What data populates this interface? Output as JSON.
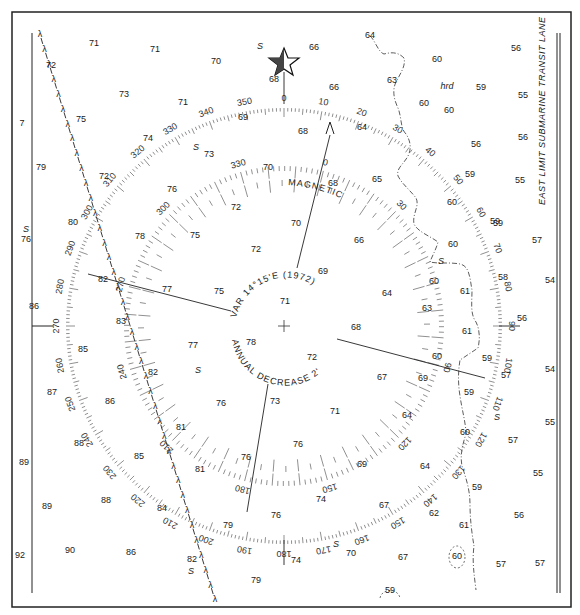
{
  "chart": {
    "type": "nautical-chart-compass-rose",
    "colors": {
      "ink": "#1a1a1a",
      "paper": "#ffffff",
      "frame": "#222222"
    },
    "compass": {
      "center": [
        284,
        326
      ],
      "true_ring": {
        "radius": 218,
        "rotation_deg": 0,
        "labels": [
          "0",
          "10",
          "20",
          "30",
          "40",
          "50",
          "60",
          "70",
          "80",
          "90",
          "100",
          "110",
          "120",
          "130",
          "140",
          "150",
          "160",
          "170",
          "180",
          "190",
          "200",
          "210",
          "220",
          "230",
          "240",
          "250",
          "260",
          "270",
          "280",
          "290",
          "300",
          "310",
          "320",
          "330",
          "340",
          "350"
        ]
      },
      "magnetic_ring": {
        "radius": 160,
        "rotation_deg": 14.25,
        "visible_labels": [
          "0",
          "30",
          "90",
          "120",
          "150",
          "180",
          "210",
          "240",
          "270",
          "300",
          "330"
        ]
      },
      "magnetic_label": "MAGNETIC",
      "variation_text": "VAR 14°15'E (1972)",
      "annual_text": "ANNUAL DECREASE 2'",
      "north_star": "star-icon"
    },
    "lane_label": "EAST LIMIT SUBMARINE TRANSIT LANE",
    "seabed_notes": [
      {
        "text": "S",
        "x": 260,
        "y": 47
      },
      {
        "text": "S",
        "x": 196,
        "y": 148
      },
      {
        "text": "S",
        "x": 26,
        "y": 230
      },
      {
        "text": "S",
        "x": 198,
        "y": 371
      },
      {
        "text": "S",
        "x": 441,
        "y": 262
      },
      {
        "text": "S",
        "x": 497,
        "y": 418
      },
      {
        "text": "S",
        "x": 336,
        "y": 545
      },
      {
        "text": "S",
        "x": 191,
        "y": 572
      },
      {
        "text": "hrd",
        "x": 447,
        "y": 87
      }
    ],
    "soundings": [
      {
        "v": "71",
        "x": 94,
        "y": 44
      },
      {
        "v": "71",
        "x": 155,
        "y": 50
      },
      {
        "v": "70",
        "x": 216,
        "y": 62
      },
      {
        "v": "66",
        "x": 314,
        "y": 48
      },
      {
        "v": "64",
        "x": 370,
        "y": 36
      },
      {
        "v": "72",
        "x": 51,
        "y": 66
      },
      {
        "v": "68",
        "x": 274,
        "y": 80
      },
      {
        "v": "60",
        "x": 437,
        "y": 60
      },
      {
        "v": "56",
        "x": 516,
        "y": 49
      },
      {
        "v": "73",
        "x": 124,
        "y": 95
      },
      {
        "v": "71",
        "x": 183,
        "y": 103
      },
      {
        "v": "66",
        "x": 334,
        "y": 88
      },
      {
        "v": "63",
        "x": 392,
        "y": 81
      },
      {
        "v": "59",
        "x": 481,
        "y": 88
      },
      {
        "v": "55",
        "x": 523,
        "y": 96
      },
      {
        "v": "7",
        "x": 22,
        "y": 124
      },
      {
        "v": "75",
        "x": 81,
        "y": 120
      },
      {
        "v": "69",
        "x": 243,
        "y": 118
      },
      {
        "v": "60",
        "x": 424,
        "y": 104
      },
      {
        "v": "60",
        "x": 449,
        "y": 111
      },
      {
        "v": "74",
        "x": 148,
        "y": 139
      },
      {
        "v": "68",
        "x": 303,
        "y": 132
      },
      {
        "v": "64",
        "x": 362,
        "y": 128
      },
      {
        "v": "56",
        "x": 476,
        "y": 145
      },
      {
        "v": "56",
        "x": 523,
        "y": 138
      },
      {
        "v": "79",
        "x": 41,
        "y": 168
      },
      {
        "v": "73",
        "x": 209,
        "y": 155
      },
      {
        "v": "72",
        "x": 104,
        "y": 177
      },
      {
        "v": "70",
        "x": 268,
        "y": 168
      },
      {
        "v": "68",
        "x": 333,
        "y": 184
      },
      {
        "v": "65",
        "x": 377,
        "y": 180
      },
      {
        "v": "59",
        "x": 470,
        "y": 175
      },
      {
        "v": "55",
        "x": 520,
        "y": 181
      },
      {
        "v": "76",
        "x": 172,
        "y": 190
      },
      {
        "v": "72",
        "x": 236,
        "y": 208
      },
      {
        "v": "60",
        "x": 452,
        "y": 203
      },
      {
        "v": "80",
        "x": 73,
        "y": 223
      },
      {
        "v": "59",
        "x": 495,
        "y": 222
      },
      {
        "v": "76",
        "x": 26,
        "y": 240
      },
      {
        "v": "78",
        "x": 140,
        "y": 237
      },
      {
        "v": "75",
        "x": 195,
        "y": 236
      },
      {
        "v": "72",
        "x": 256,
        "y": 250
      },
      {
        "v": "70",
        "x": 296,
        "y": 224
      },
      {
        "v": "66",
        "x": 359,
        "y": 241
      },
      {
        "v": "60",
        "x": 453,
        "y": 245
      },
      {
        "v": "57",
        "x": 537,
        "y": 241
      },
      {
        "v": "69",
        "x": 323,
        "y": 272
      },
      {
        "v": "59",
        "x": 498,
        "y": 224
      },
      {
        "v": "82",
        "x": 103,
        "y": 280
      },
      {
        "v": "77",
        "x": 167,
        "y": 290
      },
      {
        "v": "75",
        "x": 219,
        "y": 292
      },
      {
        "v": "71",
        "x": 285,
        "y": 302
      },
      {
        "v": "64",
        "x": 387,
        "y": 294
      },
      {
        "v": "60",
        "x": 434,
        "y": 282
      },
      {
        "v": "61",
        "x": 465,
        "y": 292
      },
      {
        "v": "58",
        "x": 503,
        "y": 278
      },
      {
        "v": "54",
        "x": 550,
        "y": 281
      },
      {
        "v": "86",
        "x": 34,
        "y": 307
      },
      {
        "v": "63",
        "x": 427,
        "y": 309
      },
      {
        "v": "56",
        "x": 522,
        "y": 319
      },
      {
        "v": "83",
        "x": 121,
        "y": 322
      },
      {
        "v": "68",
        "x": 356,
        "y": 328
      },
      {
        "v": "61",
        "x": 467,
        "y": 332
      },
      {
        "v": "85",
        "x": 83,
        "y": 350
      },
      {
        "v": "77",
        "x": 193,
        "y": 346
      },
      {
        "v": "78",
        "x": 251,
        "y": 343
      },
      {
        "v": "72",
        "x": 312,
        "y": 358
      },
      {
        "v": "60",
        "x": 437,
        "y": 357
      },
      {
        "v": "59",
        "x": 487,
        "y": 359
      },
      {
        "v": "82",
        "x": 153,
        "y": 373
      },
      {
        "v": "67",
        "x": 382,
        "y": 378
      },
      {
        "v": "69",
        "x": 423,
        "y": 379
      },
      {
        "v": "57",
        "x": 506,
        "y": 376
      },
      {
        "v": "54",
        "x": 550,
        "y": 370
      },
      {
        "v": "87",
        "x": 52,
        "y": 393
      },
      {
        "v": "59",
        "x": 469,
        "y": 393
      },
      {
        "v": "86",
        "x": 110,
        "y": 402
      },
      {
        "v": "76",
        "x": 221,
        "y": 404
      },
      {
        "v": "73",
        "x": 275,
        "y": 402
      },
      {
        "v": "71",
        "x": 335,
        "y": 412
      },
      {
        "v": "64",
        "x": 407,
        "y": 416
      },
      {
        "v": "55",
        "x": 550,
        "y": 423
      },
      {
        "v": "88",
        "x": 79,
        "y": 444
      },
      {
        "v": "81",
        "x": 181,
        "y": 428
      },
      {
        "v": "76",
        "x": 298,
        "y": 445
      },
      {
        "v": "60",
        "x": 465,
        "y": 433
      },
      {
        "v": "57",
        "x": 513,
        "y": 441
      },
      {
        "v": "89",
        "x": 24,
        "y": 463
      },
      {
        "v": "85",
        "x": 139,
        "y": 457
      },
      {
        "v": "81",
        "x": 200,
        "y": 470
      },
      {
        "v": "76",
        "x": 246,
        "y": 458
      },
      {
        "v": "69",
        "x": 362,
        "y": 465
      },
      {
        "v": "64",
        "x": 425,
        "y": 467
      },
      {
        "v": "55",
        "x": 538,
        "y": 474
      },
      {
        "v": "59",
        "x": 477,
        "y": 488
      },
      {
        "v": "74",
        "x": 321,
        "y": 500
      },
      {
        "v": "89",
        "x": 47,
        "y": 507
      },
      {
        "v": "88",
        "x": 106,
        "y": 501
      },
      {
        "v": "84",
        "x": 162,
        "y": 509
      },
      {
        "v": "67",
        "x": 384,
        "y": 506
      },
      {
        "v": "62",
        "x": 434,
        "y": 514
      },
      {
        "v": "56",
        "x": 519,
        "y": 516
      },
      {
        "v": "79",
        "x": 228,
        "y": 526
      },
      {
        "v": "76",
        "x": 276,
        "y": 516
      },
      {
        "v": "61",
        "x": 464,
        "y": 526
      },
      {
        "v": "92",
        "x": 20,
        "y": 556
      },
      {
        "v": "90",
        "x": 70,
        "y": 551
      },
      {
        "v": "86",
        "x": 131,
        "y": 553
      },
      {
        "v": "82",
        "x": 192,
        "y": 560
      },
      {
        "v": "74",
        "x": 296,
        "y": 561
      },
      {
        "v": "70",
        "x": 351,
        "y": 554
      },
      {
        "v": "67",
        "x": 403,
        "y": 558
      },
      {
        "v": "60",
        "x": 457,
        "y": 557
      },
      {
        "v": "57",
        "x": 501,
        "y": 565
      },
      {
        "v": "57",
        "x": 540,
        "y": 564
      },
      {
        "v": "79",
        "x": 256,
        "y": 581
      },
      {
        "v": "59",
        "x": 390,
        "y": 591
      }
    ]
  }
}
